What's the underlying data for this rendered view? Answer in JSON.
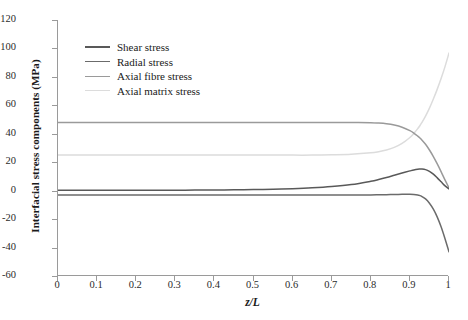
{
  "chart_data": {
    "type": "line",
    "title": "",
    "xlabel": "z/L",
    "ylabel": "Interfacial stress components (MPa)",
    "xlim": [
      0,
      1
    ],
    "ylim": [
      -60,
      120
    ],
    "xticks": [
      "0",
      "0.1",
      "0.2",
      "0.3",
      "0.4",
      "0.5",
      "0.6",
      "0.7",
      "0.8",
      "0.9",
      "1"
    ],
    "xtick_values": [
      0,
      0.1,
      0.2,
      0.3,
      0.4,
      0.5,
      0.6,
      0.7,
      0.8,
      0.9,
      1
    ],
    "yticks": [
      "120",
      "100",
      "80",
      "60",
      "40",
      "20",
      "0",
      "-20",
      "-40",
      "-60"
    ],
    "ytick_values": [
      120,
      100,
      80,
      60,
      40,
      20,
      0,
      -20,
      -40,
      -60
    ],
    "grid": false,
    "legend_position": "upper-left-inside",
    "x": [
      0,
      0.05,
      0.1,
      0.15,
      0.2,
      0.25,
      0.3,
      0.35,
      0.4,
      0.45,
      0.5,
      0.55,
      0.6,
      0.65,
      0.7,
      0.75,
      0.8,
      0.82,
      0.84,
      0.86,
      0.88,
      0.9,
      0.91,
      0.92,
      0.925,
      0.93,
      0.94,
      0.95,
      0.96,
      0.97,
      0.98,
      0.99,
      1
    ],
    "series": [
      {
        "name": "Shear stress",
        "color": "#595959",
        "values": [
          0.3,
          0.3,
          0.3,
          0.3,
          0.3,
          0.3,
          0.35,
          0.4,
          0.5,
          0.6,
          0.8,
          1.0,
          1.4,
          2.0,
          2.9,
          4.3,
          6.6,
          7.8,
          9.2,
          10.8,
          12.4,
          13.9,
          14.6,
          15.1,
          15.2,
          15.2,
          14.8,
          13.6,
          11.6,
          9.0,
          6.2,
          3.4,
          1.2
        ]
      },
      {
        "name": "Radial stress",
        "color": "#6b6b6b",
        "values": [
          -3.0,
          -3.0,
          -3.0,
          -3.0,
          -3.0,
          -3.0,
          -3.0,
          -3.0,
          -3.0,
          -3.0,
          -3.0,
          -3.0,
          -3.0,
          -3.0,
          -3.0,
          -3.0,
          -3.0,
          -2.9,
          -2.8,
          -2.7,
          -2.6,
          -2.6,
          -2.7,
          -3.0,
          -3.4,
          -4.0,
          -5.8,
          -8.8,
          -13.0,
          -18.6,
          -25.6,
          -34.0,
          -43.0
        ]
      },
      {
        "name": "Axial fibre stress",
        "color": "#9a9a9a",
        "values": [
          48.0,
          48.0,
          48.0,
          48.0,
          48.0,
          48.0,
          48.0,
          48.0,
          48.0,
          48.0,
          48.0,
          48.0,
          48.0,
          48.0,
          48.0,
          48.0,
          47.8,
          47.5,
          47.0,
          46.1,
          44.6,
          42.2,
          40.5,
          38.4,
          37.2,
          35.8,
          32.6,
          28.6,
          24.0,
          18.8,
          13.2,
          7.4,
          2.0
        ]
      },
      {
        "name": "Axial matrix stress",
        "color": "#dcdcdc",
        "values": [
          25.0,
          25.0,
          25.0,
          25.0,
          25.0,
          25.0,
          25.0,
          25.0,
          25.0,
          25.0,
          25.0,
          25.0,
          25.0,
          25.0,
          25.2,
          25.6,
          26.6,
          27.4,
          28.6,
          30.4,
          33.2,
          37.4,
          40.2,
          43.6,
          45.5,
          47.6,
          52.4,
          58.0,
          64.4,
          71.4,
          79.0,
          87.4,
          96.8
        ]
      }
    ]
  },
  "legend": {
    "items": [
      {
        "label": "Shear stress",
        "color": "#595959"
      },
      {
        "label": "Radial stress",
        "color": "#6b6b6b"
      },
      {
        "label": "Axial fibre stress",
        "color": "#9a9a9a"
      },
      {
        "label": "Axial matrix stress",
        "color": "#dcdcdc"
      }
    ]
  },
  "axes": {
    "x_title": "z/L",
    "y_title": "Interfacial stress components (MPa)"
  }
}
